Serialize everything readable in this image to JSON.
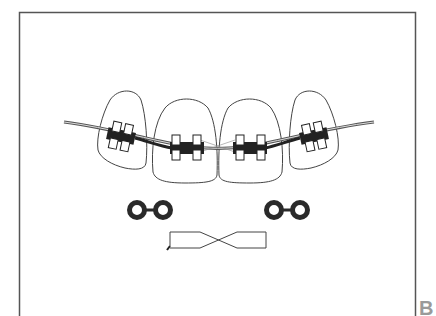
{
  "figure": {
    "panel_label": "B",
    "colors": {
      "line": "#333333",
      "frame": "#555555",
      "label": "#9a9a9a",
      "background": "#ffffff"
    },
    "teeth": [
      {
        "name": "upper-right-lateral-incisor"
      },
      {
        "name": "upper-right-central-incisor"
      },
      {
        "name": "upper-left-central-incisor"
      },
      {
        "name": "upper-left-lateral-incisor"
      }
    ],
    "components": {
      "archwire": "archwire",
      "brackets": 4,
      "elastic_ligature_chains": 2,
      "twisted_wire_ligature": 1
    }
  }
}
